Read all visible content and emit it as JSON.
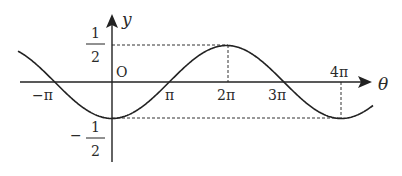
{
  "chart_data": {
    "type": "line",
    "function": "y = -1/2 cos(θ/2)",
    "xlabel": "θ",
    "ylabel": "y",
    "origin_label": "O",
    "x_ticks": [
      "-π",
      "π",
      "2π",
      "3π",
      "4π"
    ],
    "y_ticks": [
      {
        "num": "1",
        "den": "2",
        "sign": ""
      },
      {
        "num": "1",
        "den": "2",
        "sign": "−"
      }
    ],
    "x_range": [
      "-1.64π",
      "4.54π"
    ],
    "y_range": [
      -0.5,
      0.5
    ],
    "key_points": [
      {
        "x": "-π",
        "y": 0
      },
      {
        "x": "0",
        "y": -0.5
      },
      {
        "x": "π",
        "y": 0
      },
      {
        "x": "2π",
        "y": 0.5
      },
      {
        "x": "3π",
        "y": 0
      },
      {
        "x": "4π",
        "y": -0.5
      }
    ],
    "guides": [
      "dashed y=1/2 from axis to 2π",
      "dashed y=-1/2 from axis to 4π",
      "dashed vertical at 2π",
      "dashed vertical at 4π"
    ],
    "grid": false,
    "legend": null
  },
  "labels": {
    "y_axis": "y",
    "x_axis": "θ",
    "origin": "O",
    "neg_pi": "−π",
    "pi": "π",
    "two_pi": "2π",
    "three_pi": "3π",
    "four_pi": "4π",
    "half_num": "1",
    "half_den": "2",
    "neg_half_sign": "−",
    "neg_half_num": "1",
    "neg_half_den": "2"
  }
}
